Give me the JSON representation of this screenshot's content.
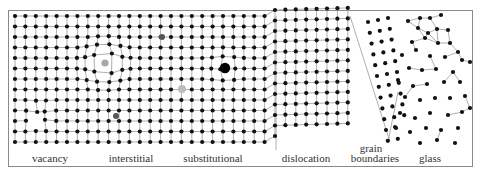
{
  "figure": {
    "labels": [
      {
        "key": "vacancy",
        "text": "vacancy",
        "x": 50,
        "y": 153
      },
      {
        "key": "interstitial",
        "text": "interstitial",
        "x": 131,
        "y": 153
      },
      {
        "key": "substitutional",
        "text": "substitutional",
        "x": 213,
        "y": 153
      },
      {
        "key": "dislocation",
        "text": "dislocation",
        "x": 306,
        "y": 153
      },
      {
        "key": "grain-boundaries-line1",
        "text": "grain",
        "x": 371,
        "y": 143
      },
      {
        "key": "grain-boundaries-line2",
        "text": "boundaries",
        "x": 375,
        "y": 153
      },
      {
        "key": "glass",
        "text": "glass",
        "x": 430,
        "y": 153
      }
    ],
    "colors": {
      "atom": "#111111",
      "bond": "#9a9a9a",
      "interstitial_atom": "#a8a8a8",
      "substitutional_light": "#bdbdbd",
      "substitutional_dark": "#555555",
      "large_atom": "#000000",
      "frame": "#8a8a8a",
      "label": "#333333"
    },
    "lattice": {
      "x0": 15,
      "y0": 16,
      "dx": 10.4,
      "dy": 10.5,
      "rows": 13,
      "cols_left": 26,
      "cols_right_start": 27,
      "cols_right_end": 36
    }
  }
}
